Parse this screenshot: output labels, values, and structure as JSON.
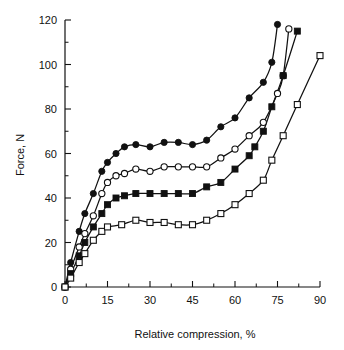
{
  "chart_data": {
    "type": "line",
    "title": "",
    "xlabel": "Relative compression, %",
    "ylabel": "Force, N",
    "xlim": [
      0,
      90
    ],
    "ylim": [
      0,
      120
    ],
    "xticks": [
      0,
      15,
      30,
      45,
      60,
      75,
      90
    ],
    "yticks": [
      0,
      20,
      40,
      60,
      80,
      100,
      120
    ],
    "xticklabels": [
      "0",
      "15",
      "30",
      "45",
      "60",
      "75",
      "90"
    ],
    "yticklabels": [
      "0",
      "20",
      "40",
      "60",
      "80",
      "100",
      "120"
    ],
    "x_minor_step": 7.5,
    "y_minor_step": 10,
    "grid": false,
    "legend": "none",
    "series": [
      {
        "name": "series-1-filled-circle",
        "marker": "filled-circle",
        "color": "#111111",
        "points": [
          {
            "x": 0,
            "y": 0
          },
          {
            "x": 2,
            "y": 11
          },
          {
            "x": 5,
            "y": 25
          },
          {
            "x": 7,
            "y": 33
          },
          {
            "x": 10,
            "y": 42
          },
          {
            "x": 13,
            "y": 52
          },
          {
            "x": 15,
            "y": 56
          },
          {
            "x": 18,
            "y": 60
          },
          {
            "x": 21,
            "y": 63
          },
          {
            "x": 25,
            "y": 64
          },
          {
            "x": 30,
            "y": 63
          },
          {
            "x": 35,
            "y": 65
          },
          {
            "x": 40,
            "y": 65
          },
          {
            "x": 45,
            "y": 64
          },
          {
            "x": 50,
            "y": 66
          },
          {
            "x": 55,
            "y": 72
          },
          {
            "x": 60,
            "y": 76
          },
          {
            "x": 65,
            "y": 85
          },
          {
            "x": 70,
            "y": 92
          },
          {
            "x": 73,
            "y": 101
          },
          {
            "x": 75,
            "y": 118
          }
        ]
      },
      {
        "name": "series-2-open-circle",
        "marker": "open-circle",
        "color": "#111111",
        "points": [
          {
            "x": 0,
            "y": 0
          },
          {
            "x": 2,
            "y": 8
          },
          {
            "x": 5,
            "y": 18
          },
          {
            "x": 7,
            "y": 24
          },
          {
            "x": 10,
            "y": 32
          },
          {
            "x": 13,
            "y": 42
          },
          {
            "x": 15,
            "y": 47
          },
          {
            "x": 18,
            "y": 50
          },
          {
            "x": 21,
            "y": 51
          },
          {
            "x": 25,
            "y": 53
          },
          {
            "x": 30,
            "y": 52
          },
          {
            "x": 35,
            "y": 54
          },
          {
            "x": 40,
            "y": 54
          },
          {
            "x": 45,
            "y": 54
          },
          {
            "x": 50,
            "y": 54
          },
          {
            "x": 55,
            "y": 58
          },
          {
            "x": 60,
            "y": 62
          },
          {
            "x": 65,
            "y": 68
          },
          {
            "x": 70,
            "y": 74
          },
          {
            "x": 75,
            "y": 87
          },
          {
            "x": 77,
            "y": 95
          },
          {
            "x": 79,
            "y": 116
          }
        ]
      },
      {
        "name": "series-3-filled-square",
        "marker": "filled-square",
        "color": "#111111",
        "points": [
          {
            "x": 0,
            "y": 0
          },
          {
            "x": 2,
            "y": 6
          },
          {
            "x": 5,
            "y": 14
          },
          {
            "x": 7,
            "y": 20
          },
          {
            "x": 10,
            "y": 27
          },
          {
            "x": 13,
            "y": 33
          },
          {
            "x": 15,
            "y": 37
          },
          {
            "x": 18,
            "y": 40
          },
          {
            "x": 21,
            "y": 41
          },
          {
            "x": 25,
            "y": 42
          },
          {
            "x": 30,
            "y": 42
          },
          {
            "x": 35,
            "y": 42
          },
          {
            "x": 40,
            "y": 42
          },
          {
            "x": 45,
            "y": 42
          },
          {
            "x": 50,
            "y": 45
          },
          {
            "x": 55,
            "y": 47
          },
          {
            "x": 60,
            "y": 53
          },
          {
            "x": 65,
            "y": 59
          },
          {
            "x": 67,
            "y": 63
          },
          {
            "x": 70,
            "y": 70
          },
          {
            "x": 73,
            "y": 81
          },
          {
            "x": 77,
            "y": 95
          },
          {
            "x": 82,
            "y": 115
          }
        ]
      },
      {
        "name": "series-4-open-square",
        "marker": "open-square",
        "color": "#111111",
        "points": [
          {
            "x": 0,
            "y": 0
          },
          {
            "x": 2,
            "y": 4
          },
          {
            "x": 5,
            "y": 11
          },
          {
            "x": 7,
            "y": 15
          },
          {
            "x": 10,
            "y": 21
          },
          {
            "x": 13,
            "y": 25
          },
          {
            "x": 15,
            "y": 27
          },
          {
            "x": 20,
            "y": 28
          },
          {
            "x": 25,
            "y": 30
          },
          {
            "x": 30,
            "y": 29
          },
          {
            "x": 35,
            "y": 29
          },
          {
            "x": 40,
            "y": 28
          },
          {
            "x": 45,
            "y": 28
          },
          {
            "x": 50,
            "y": 30
          },
          {
            "x": 55,
            "y": 33
          },
          {
            "x": 60,
            "y": 37
          },
          {
            "x": 65,
            "y": 42
          },
          {
            "x": 70,
            "y": 48
          },
          {
            "x": 73,
            "y": 57
          },
          {
            "x": 77,
            "y": 68
          },
          {
            "x": 82,
            "y": 82
          },
          {
            "x": 90,
            "y": 104
          }
        ]
      }
    ]
  }
}
